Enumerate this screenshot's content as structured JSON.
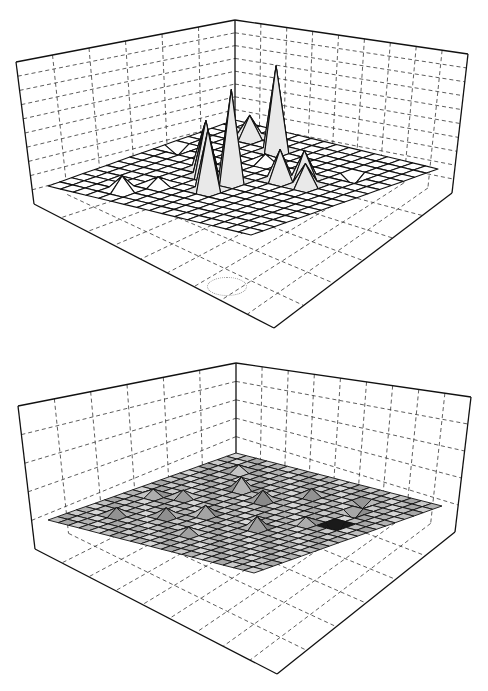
{
  "chart_data": [
    {
      "type": "surface3d",
      "title": "",
      "xlabel": "",
      "ylabel": "",
      "zlabel": "",
      "grid": true,
      "wall_vertical_divisions_left": 6,
      "wall_vertical_divisions_right": 9,
      "wall_horizontal_divisions": 10,
      "mesh_resolution": [
        16,
        16
      ],
      "surface_shading": "white",
      "box": {
        "back_top": [
          235,
          20
        ],
        "left_top": [
          16,
          62
        ],
        "right_top": [
          468,
          54
        ],
        "back_bottom": [
          235,
          148
        ],
        "left_bottom": [
          34,
          204
        ],
        "right_bottom": [
          452,
          193
        ],
        "front_bottom": [
          274,
          328
        ]
      },
      "mesh": {
        "left": [
          48,
          186
        ],
        "back": [
          235,
          120
        ],
        "right": [
          438,
          169
        ],
        "front": [
          271,
          286
        ]
      },
      "peaks": [
        {
          "i": 6,
          "j": 3,
          "height": 85,
          "label": "tall spike left"
        },
        {
          "i": 3,
          "j": 2,
          "height": 22
        },
        {
          "i": 8,
          "j": 9,
          "height": 92,
          "label": "tallest spike"
        },
        {
          "i": 6,
          "j": 9,
          "height": 55
        },
        {
          "i": 8,
          "j": 11,
          "height": 60
        },
        {
          "i": 5,
          "j": 8,
          "height": 45
        },
        {
          "i": 10,
          "j": 7,
          "height": 30
        },
        {
          "i": 11,
          "j": 6,
          "height": 28
        },
        {
          "i": 12,
          "j": 7,
          "height": 22
        },
        {
          "i": 4,
          "j": 14,
          "height": 14
        },
        {
          "i": 7,
          "j": 5,
          "height": 8
        },
        {
          "i": 5,
          "j": 12,
          "height": 8
        },
        {
          "i": 1,
          "j": 6,
          "height": -8
        },
        {
          "i": 13,
          "j": 4,
          "height": -10
        }
      ]
    },
    {
      "type": "surface3d",
      "title": "",
      "xlabel": "",
      "ylabel": "",
      "zlabel": "",
      "grid": true,
      "wall_vertical_divisions_left": 6,
      "wall_vertical_divisions_right": 9,
      "wall_horizontal_divisions": 5,
      "mesh_resolution": [
        20,
        20
      ],
      "surface_shading": "gray",
      "box": {
        "back_top": [
          236,
          23
        ],
        "left_top": [
          18,
          66
        ],
        "right_top": [
          471,
          57
        ],
        "back_bottom": [
          236,
          115
        ],
        "left_bottom": [
          35,
          209
        ],
        "right_bottom": [
          455,
          192
        ],
        "front_bottom": [
          277,
          334
        ]
      },
      "mesh": {
        "left": [
          48,
          180
        ],
        "back": [
          236,
          113
        ],
        "right": [
          442,
          166
        ],
        "front": [
          270,
          277
        ]
      },
      "peaks": [
        {
          "i": 6,
          "j": 6,
          "height": 12
        },
        {
          "i": 9,
          "j": 7,
          "height": 10
        },
        {
          "i": 8,
          "j": 12,
          "height": 9
        },
        {
          "i": 13,
          "j": 12,
          "height": 11
        },
        {
          "i": 4,
          "j": 10,
          "height": 7
        },
        {
          "i": 11,
          "j": 4,
          "height": 7
        },
        {
          "i": 6,
          "j": 14,
          "height": 8
        },
        {
          "i": 3,
          "j": 16,
          "height": 7
        },
        {
          "i": 10,
          "j": 16,
          "height": 6
        },
        {
          "i": 15,
          "j": 9,
          "height": 6
        },
        {
          "i": 17,
          "j": 8,
          "height": -14
        },
        {
          "i": 16,
          "j": 5,
          "height": -8
        },
        {
          "i": 15,
          "j": 3,
          "height": -6
        },
        {
          "i": 3,
          "j": 3,
          "height": 6
        },
        {
          "i": 2,
          "j": 11,
          "height": 6
        }
      ]
    }
  ]
}
